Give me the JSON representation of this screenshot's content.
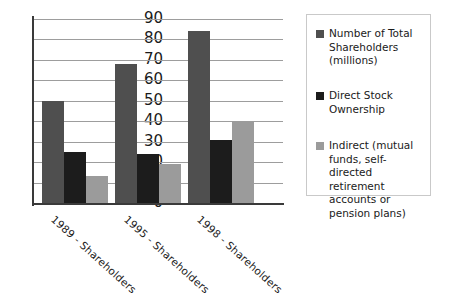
{
  "chart_data": {
    "type": "bar",
    "title": "",
    "subtitle": "",
    "xlabel": "",
    "ylabel": "",
    "ylim": [
      0,
      90
    ],
    "yticks": [
      90,
      80,
      70,
      60,
      50,
      40,
      30,
      20,
      10,
      0
    ],
    "grid": true,
    "legend_position": "right",
    "categories": [
      "1989 - Shareholders",
      "1995 - Shareholders",
      "1998 - Shareholders"
    ],
    "series": [
      {
        "name": "Number of Total Shareholders (millions)",
        "color": "#4f4f4f",
        "values": [
          50,
          68,
          84
        ]
      },
      {
        "name": "Direct Stock Ownership",
        "color": "#1c1c1c",
        "values": [
          25,
          24,
          31
        ]
      },
      {
        "name": "Indirect (mutual funds, self-directed retirement accounts or pension plans)",
        "color": "#9b9b9b",
        "values": [
          13,
          19,
          40
        ]
      }
    ]
  },
  "legend": {
    "entries": [
      {
        "label": "Number of Total Shareholders (millions)",
        "color": "#4f4f4f"
      },
      {
        "label": "Direct Stock Ownership",
        "color": "#1c1c1c"
      },
      {
        "label": "Indirect (mutual funds, self-directed retirement accounts or pension plans)",
        "color": "#9b9b9b"
      }
    ]
  },
  "colors": {
    "total_shareholders": "#4f4f4f",
    "direct_ownership": "#1c1c1c",
    "indirect_ownership": "#9b9b9b",
    "axis": "#3a3a3a",
    "gridline": "#9d9d9d",
    "legend_border": "#c9c9c9",
    "background": "#ffffff"
  }
}
